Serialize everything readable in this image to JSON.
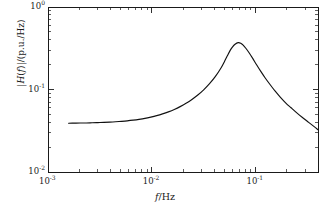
{
  "chart_data": {
    "type": "line",
    "title": "",
    "xlabel": "f/Hz",
    "ylabel": "|H(f)|/(p.u./Hz)",
    "xscale": "log",
    "yscale": "log",
    "xlim": [
      0.001,
      0.4
    ],
    "ylim": [
      0.01,
      1.0
    ],
    "grid": false,
    "legend": null,
    "xticks": [
      {
        "value": 0.001,
        "label_mantissa": "10",
        "label_exponent": "-3"
      },
      {
        "value": 0.01,
        "label_mantissa": "10",
        "label_exponent": "-2"
      },
      {
        "value": 0.1,
        "label_mantissa": "10",
        "label_exponent": "-1"
      }
    ],
    "yticks": [
      {
        "value": 1.0,
        "label_mantissa": "10",
        "label_exponent": "0"
      },
      {
        "value": 0.1,
        "label_mantissa": "10",
        "label_exponent": "-1"
      },
      {
        "value": 0.01,
        "label_mantissa": "10",
        "label_exponent": "-2"
      }
    ],
    "series": [
      {
        "name": "|H(f)|",
        "color": "#111111",
        "peak_x": 0.068,
        "peak_y": 0.37,
        "x": [
          0.00158,
          0.0018,
          0.00205,
          0.00234,
          0.00266,
          0.00303,
          0.00345,
          0.00393,
          0.00448,
          0.0051,
          0.00581,
          0.00662,
          0.00754,
          0.00859,
          0.00979,
          0.01115,
          0.0127,
          0.01447,
          0.01649,
          0.01878,
          0.0214,
          0.02438,
          0.02777,
          0.03164,
          0.03605,
          0.04107,
          0.04679,
          0.05,
          0.0533,
          0.0568,
          0.0601,
          0.0635,
          0.068,
          0.072,
          0.076,
          0.081,
          0.087,
          0.094,
          0.102,
          0.112,
          0.124,
          0.138,
          0.154,
          0.173,
          0.195,
          0.22,
          0.25,
          0.285,
          0.325,
          0.37,
          0.4
        ],
        "y": [
          0.039,
          0.0391,
          0.0392,
          0.0393,
          0.0395,
          0.0397,
          0.0399,
          0.0402,
          0.0406,
          0.0411,
          0.0417,
          0.0425,
          0.0435,
          0.0447,
          0.0463,
          0.0482,
          0.0506,
          0.0536,
          0.0573,
          0.062,
          0.068,
          0.0757,
          0.0857,
          0.099,
          0.1175,
          0.144,
          0.185,
          0.216,
          0.254,
          0.296,
          0.329,
          0.354,
          0.37,
          0.364,
          0.345,
          0.314,
          0.277,
          0.238,
          0.201,
          0.167,
          0.138,
          0.115,
          0.096,
          0.081,
          0.069,
          0.06,
          0.052,
          0.0455,
          0.04,
          0.0352,
          0.0325
        ]
      }
    ]
  }
}
